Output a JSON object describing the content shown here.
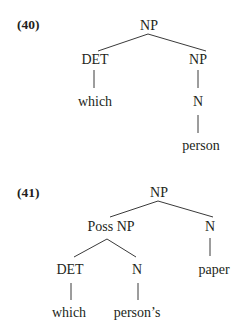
{
  "examples": [
    {
      "number": "(40)",
      "tree": {
        "root": "NP",
        "det": "DET",
        "np": "NP",
        "det_word": "which",
        "n": "N",
        "n_word": "person"
      }
    },
    {
      "number": "(41)",
      "tree": {
        "root": "NP",
        "possnp": "Poss NP",
        "n_right": "N",
        "det": "DET",
        "n_mid": "N",
        "n_right_word": "paper",
        "det_word": "which",
        "n_mid_word": "person’s"
      }
    }
  ]
}
